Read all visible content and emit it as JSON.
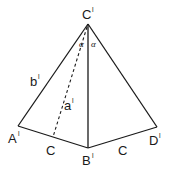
{
  "diagram": {
    "type": "geometry-figure",
    "stroke_color": "#1a1a1a",
    "background": "#ffffff",
    "points": {
      "apex": {
        "label": "C",
        "prime": "l",
        "x": 88,
        "y": 24
      },
      "left": {
        "label": "A",
        "prime": "l",
        "x": 18,
        "y": 126
      },
      "bottom": {
        "label": "B",
        "prime": "l",
        "x": 88,
        "y": 148
      },
      "right": {
        "label": "D",
        "prime": "l",
        "x": 157,
        "y": 127
      }
    },
    "edge_labels": {
      "left_side": {
        "text": "b",
        "prime": "l"
      },
      "dashed_median": {
        "text": "a",
        "prime": "l"
      },
      "bottom_left": {
        "text": "C"
      },
      "bottom_right": {
        "text": "C"
      }
    },
    "angle_labels": {
      "left_angle": "α",
      "right_angle": "α"
    }
  }
}
